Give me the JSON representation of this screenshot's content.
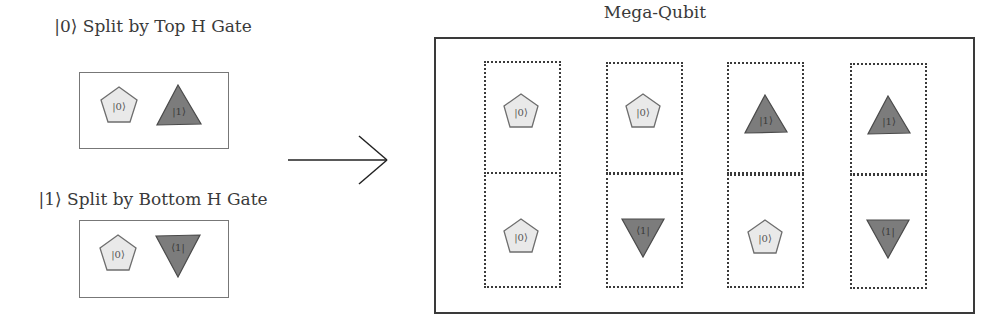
{
  "colors": {
    "zero_fill": "#e9e9e9",
    "zero_stroke": "#6e6e6e",
    "one_fill": "#7c7c7c",
    "one_stroke": "#4a4a4a",
    "frame": "#3a3a3a"
  },
  "left_panels": [
    {
      "title": "|0⟩ Split by Top H Gate",
      "shapes": [
        {
          "type": "pentagon",
          "label": "|0⟩"
        },
        {
          "type": "triangle-up",
          "label": "|1⟩"
        }
      ]
    },
    {
      "title": "|1⟩ Split by Bottom H Gate",
      "shapes": [
        {
          "type": "pentagon",
          "label": "|0⟩"
        },
        {
          "type": "triangle-down",
          "label": "⟨1|"
        }
      ]
    }
  ],
  "arrow": {
    "direction": "right"
  },
  "mega_qubit": {
    "title": "Mega-Qubit",
    "columns": [
      {
        "top": {
          "type": "pentagon",
          "label": "|0⟩"
        },
        "bottom": {
          "type": "pentagon",
          "label": "|0⟩"
        }
      },
      {
        "top": {
          "type": "pentagon",
          "label": "|0⟩"
        },
        "bottom": {
          "type": "triangle-down",
          "label": "⟨1|"
        }
      },
      {
        "top": {
          "type": "triangle-up",
          "label": "|1⟩"
        },
        "bottom": {
          "type": "pentagon",
          "label": "|0⟩"
        }
      },
      {
        "top": {
          "type": "triangle-up",
          "label": "|1⟩"
        },
        "bottom": {
          "type": "triangle-down",
          "label": "⟨1|"
        }
      }
    ]
  }
}
